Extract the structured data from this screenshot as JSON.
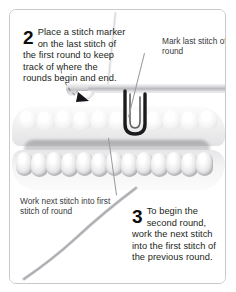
{
  "page": {
    "kind": "instructional-photo-panel",
    "frame_color": "#c9c9cb",
    "background": "#ffffff",
    "text_color": "#231f20",
    "annotation_color": "#3a3a3c"
  },
  "steps": [
    {
      "number": "2",
      "text": "Place a stitch marker on the last stitch of the first round to keep track of where the rounds begin and end."
    },
    {
      "number": "3",
      "text": "To begin the second round, work the next stitch into the first stitch of the previous round."
    }
  ],
  "annotations": [
    {
      "name": "mark-last-stitch",
      "text": "Mark last stitch of round"
    },
    {
      "name": "work-next-stitch",
      "text": "Work next stitch into first stitch of round"
    }
  ],
  "photo": {
    "objects": [
      {
        "name": "crochet-hook",
        "description": "metal crochet hook shaft with tapered head"
      },
      {
        "name": "stitch-marker",
        "description": "dark U-shaped locking stitch marker"
      },
      {
        "name": "crochet-fabric",
        "description": "band of single crochet stitches worked in a round"
      },
      {
        "name": "yarn-tail",
        "description": "yarn strand trailing to lower left"
      }
    ],
    "pointers": [
      {
        "name": "dashed-arrow",
        "description": "dashed curved arrow indicating hook insertion point"
      },
      {
        "name": "leader-line-marker",
        "description": "line from annotation to stitch marker"
      },
      {
        "name": "leader-line-stitch",
        "description": "line from annotation to first stitch of round"
      }
    ]
  }
}
